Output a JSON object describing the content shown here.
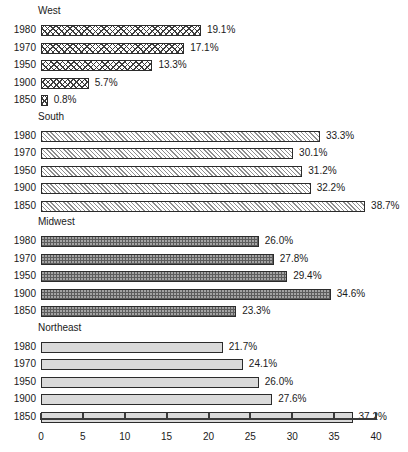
{
  "chart_data": {
    "type": "bar",
    "orientation": "horizontal",
    "title": "",
    "xlabel": "",
    "ylabel": "",
    "xlim": [
      0,
      40
    ],
    "xticks": [
      0,
      5,
      10,
      15,
      20,
      25,
      30,
      35,
      40
    ],
    "xtick_labels": [
      "0",
      "5",
      "10",
      "15",
      "20",
      "25",
      "30",
      "35",
      "40"
    ],
    "grid": false,
    "legend": "none",
    "value_suffix": "%",
    "groups": [
      {
        "name": "West",
        "pattern": "zigzag-hatch",
        "categories": [
          "1980",
          "1970",
          "1950",
          "1900",
          "1850"
        ],
        "values": [
          19.1,
          17.1,
          13.3,
          5.7,
          0.8
        ],
        "labels": [
          "19.1%",
          "17.1%",
          "13.3%",
          "5.7%",
          "0.8%"
        ]
      },
      {
        "name": "South",
        "pattern": "diagonal-hatch",
        "categories": [
          "1980",
          "1970",
          "1950",
          "1900",
          "1850"
        ],
        "values": [
          33.3,
          30.1,
          31.2,
          32.2,
          38.7
        ],
        "labels": [
          "33.3%",
          "30.1%",
          "31.2%",
          "32.2%",
          "38.7%"
        ]
      },
      {
        "name": "Midwest",
        "pattern": "dark-dotted",
        "categories": [
          "1980",
          "1970",
          "1950",
          "1900",
          "1850"
        ],
        "values": [
          26.0,
          27.8,
          29.4,
          34.6,
          23.3
        ],
        "labels": [
          "26.0%",
          "27.8%",
          "29.4%",
          "34.6%",
          "23.3%"
        ]
      },
      {
        "name": "Northeast",
        "pattern": "solid-light",
        "categories": [
          "1980",
          "1970",
          "1950",
          "1900",
          "1850"
        ],
        "values": [
          21.7,
          24.1,
          26.0,
          27.6,
          37.2
        ],
        "labels": [
          "21.7%",
          "24.1%",
          "26.0%",
          "27.6%",
          "37.2%"
        ]
      }
    ]
  },
  "colors": {
    "axis": "#3a3a3a",
    "bar_outline": "#2b2b2b",
    "text": "#1a1a1a",
    "background": "#ffffff",
    "midwest_fill": "#5c5c5c",
    "northeast_fill": "#dadada",
    "south_hatch": "#8e8e8e",
    "west_hatch": "#3d3d3d"
  }
}
